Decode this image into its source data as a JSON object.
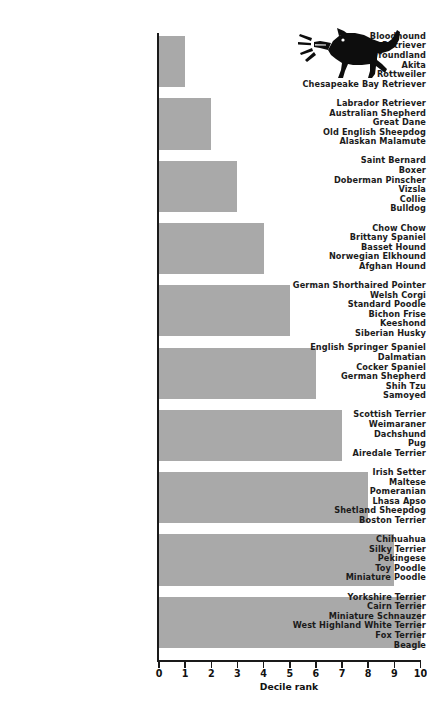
{
  "chart_data": {
    "type": "bar",
    "orientation": "horizontal",
    "title": "",
    "xlabel": "Decile rank",
    "ylabel": "",
    "xlim": [
      0,
      10
    ],
    "xticks": [
      "0",
      "1",
      "2",
      "3",
      "4",
      "5",
      "6",
      "7",
      "8",
      "9",
      "10"
    ],
    "grid": false,
    "legend": null,
    "bar_color": "#a9a9a9",
    "axis_color": "#1a1a1a",
    "categories": [
      "Bloodhound / Golden Retriever / Newfoundland / Akita / Rottweiler / Chesapeake Bay Retriever",
      "Labrador Retriever / Australian Shepherd / Great Dane / Old English Sheepdog / Alaskan Malamute",
      "Saint Bernard / Boxer / Doberman Pinscher / Vizsla / Collie / Bulldog",
      "Chow Chow / Brittany Spaniel / Basset Hound / Norwegian Elkhound / Afghan Hound",
      "German Shorthaired Pointer / Welsh Corgi / Standard Poodle / Bichon Frise / Keeshond / Siberian Husky",
      "English Springer Spaniel / Dalmatian / Cocker Spaniel / German Shepherd / Shih Tzu / Samoyed",
      "Scottish Terrier / Weimaraner / Dachshund / Pug / Airedale Terrier",
      "Irish Setter / Maltese / Pomeranian / Lhasa Apso / Shetland Sheepdog / Boston Terrier",
      "Chihuahua / Silky Terrier / Pekingese / Toy Poodle / Miniature Poodle",
      "Yorkshire Terrier / Cairn Terrier / Miniature Schnauzer / West Highland White Terrier / Fox Terrier / Beagle"
    ],
    "values": [
      1,
      2,
      3,
      4,
      5,
      6,
      7,
      8,
      9,
      10
    ]
  },
  "groups": [
    {
      "value": 1,
      "breeds": [
        "Bloodhound",
        "Golden Retriever",
        "Newfoundland",
        "Akita",
        "Rottweiler",
        "Chesapeake Bay Retriever"
      ]
    },
    {
      "value": 2,
      "breeds": [
        "Labrador Retriever",
        "Australian Shepherd",
        "Great Dane",
        "Old English Sheepdog",
        "Alaskan Malamute"
      ]
    },
    {
      "value": 3,
      "breeds": [
        "Saint Bernard",
        "Boxer",
        "Doberman Pinscher",
        "Vizsla",
        "Collie",
        "Bulldog"
      ]
    },
    {
      "value": 4,
      "breeds": [
        "Chow Chow",
        "Brittany Spaniel",
        "Basset Hound",
        "Norwegian Elkhound",
        "Afghan Hound"
      ]
    },
    {
      "value": 5,
      "breeds": [
        "German Shorthaired Pointer",
        "Welsh Corgi",
        "Standard Poodle",
        "Bichon Frise",
        "Keeshond",
        "Siberian Husky"
      ]
    },
    {
      "value": 6,
      "breeds": [
        "English Springer Spaniel",
        "Dalmatian",
        "Cocker Spaniel",
        "German Shepherd",
        "Shih Tzu",
        "Samoyed"
      ]
    },
    {
      "value": 7,
      "breeds": [
        "Scottish Terrier",
        "Weimaraner",
        "Dachshund",
        "Pug",
        "Airedale Terrier"
      ]
    },
    {
      "value": 8,
      "breeds": [
        "Irish Setter",
        "Maltese",
        "Pomeranian",
        "Lhasa Apso",
        "Shetland Sheepdog",
        "Boston Terrier"
      ]
    },
    {
      "value": 9,
      "breeds": [
        "Chihuahua",
        "Silky Terrier",
        "Pekingese",
        "Toy Poodle",
        "Miniature Poodle"
      ]
    },
    {
      "value": 10,
      "breeds": [
        "Yorkshire Terrier",
        "Cairn Terrier",
        "Miniature Schnauzer",
        "West Highland White Terrier",
        "Fox Terrier",
        "Beagle"
      ]
    }
  ],
  "axis": {
    "title": "Decile rank",
    "ticks": [
      "0",
      "1",
      "2",
      "3",
      "4",
      "5",
      "6",
      "7",
      "8",
      "9",
      "10"
    ]
  },
  "illustration": {
    "name": "barking-dog-silhouette"
  }
}
